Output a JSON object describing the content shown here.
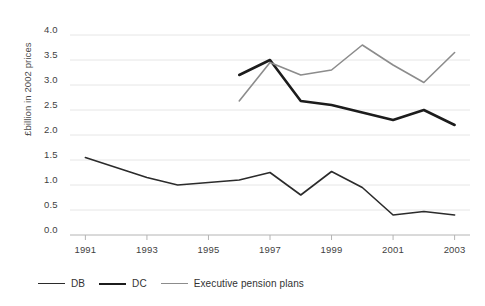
{
  "chart_data": {
    "type": "line",
    "title": "",
    "xlabel": "",
    "ylabel": "£billion in 2002 prices",
    "xlim": [
      1990.5,
      2003.5
    ],
    "ylim": [
      0.0,
      4.0
    ],
    "grid": true,
    "legend_position": "bottom-left",
    "x_tick_labels": [
      "1991",
      "1993",
      "1995",
      "1997",
      "1999",
      "2001",
      "2003"
    ],
    "x_ticks": [
      1991,
      1993,
      1995,
      1997,
      1999,
      2001,
      2003
    ],
    "y_tick_labels": [
      "0.0",
      "0.5",
      "1.0",
      "1.5",
      "2.0",
      "2.5",
      "3.0",
      "3.5",
      "4.0"
    ],
    "y_ticks": [
      0.0,
      0.5,
      1.0,
      1.5,
      2.0,
      2.5,
      3.0,
      3.5,
      4.0
    ],
    "series": [
      {
        "name": "DB",
        "color": "#2b2b2b",
        "width": 1.6,
        "x": [
          1991,
          1992,
          1993,
          1994,
          1995,
          1996,
          1997,
          1998,
          1999,
          2000,
          2001,
          2002,
          2003
        ],
        "values": [
          1.55,
          1.35,
          1.15,
          1.0,
          1.05,
          1.1,
          1.25,
          0.8,
          1.27,
          0.95,
          0.4,
          0.47,
          0.4
        ]
      },
      {
        "name": "DC",
        "color": "#1c1c1c",
        "width": 2.6,
        "x": [
          1996,
          1997,
          1998,
          1999,
          2000,
          2001,
          2002,
          2003
        ],
        "values": [
          3.2,
          3.5,
          2.68,
          2.6,
          2.45,
          2.3,
          2.5,
          2.2
        ]
      },
      {
        "name": "Executive pension plans",
        "color": "#8c8c8c",
        "width": 1.6,
        "x": [
          1996,
          1997,
          1998,
          1999,
          2000,
          2001,
          2002,
          2003
        ],
        "values": [
          2.68,
          3.45,
          3.2,
          3.3,
          3.8,
          3.4,
          3.05,
          3.65
        ]
      }
    ]
  },
  "legend": {
    "items": [
      {
        "label": "DB",
        "swatch": "db-line-swatch"
      },
      {
        "label": "DC",
        "swatch": "dc-line-swatch"
      },
      {
        "label": "Executive pension plans",
        "swatch": "executive-line-swatch"
      }
    ]
  }
}
